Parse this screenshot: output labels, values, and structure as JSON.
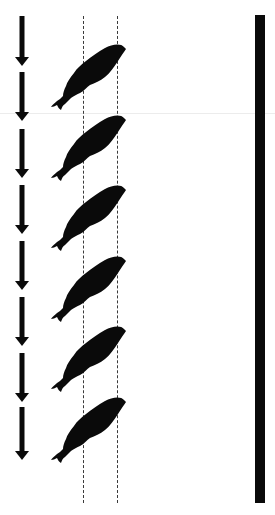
{
  "diagram": {
    "description": "Sequence of six fish silhouettes swimming diagonally upward-right between two vertical dashed lines, with a column of downward arrows on the left and a thick vertical bar on the right",
    "colors": {
      "ink": "#0a0a0a",
      "dashed": "#3a3a3a",
      "background": "#ffffff"
    },
    "arrows": {
      "direction": "down",
      "count": 8,
      "x_center": 22,
      "items": [
        {
          "top": 16,
          "bottom": 66
        },
        {
          "top": 72,
          "bottom": 121
        },
        {
          "top": 129,
          "bottom": 178
        },
        {
          "top": 185,
          "bottom": 234
        },
        {
          "top": 241,
          "bottom": 290
        },
        {
          "top": 297,
          "bottom": 346
        },
        {
          "top": 353,
          "bottom": 402
        },
        {
          "top": 407,
          "bottom": 460
        }
      ]
    },
    "dashed_lines": [
      {
        "x": 83,
        "top": 16,
        "bottom": 503
      },
      {
        "x": 117,
        "top": 16,
        "bottom": 503
      }
    ],
    "fish": {
      "count": 6,
      "orientation": "head up-right, tail down-left",
      "items": [
        {
          "left": 50,
          "top": 43
        },
        {
          "left": 50,
          "top": 114
        },
        {
          "left": 50,
          "top": 184
        },
        {
          "left": 50,
          "top": 255
        },
        {
          "left": 50,
          "top": 325
        },
        {
          "left": 50,
          "top": 396
        }
      ]
    },
    "wall": {
      "left": 255,
      "top": 15,
      "width": 10,
      "height": 488
    }
  }
}
